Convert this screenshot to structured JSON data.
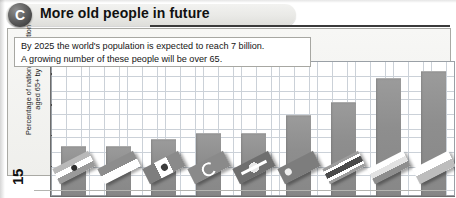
{
  "header": {
    "badge_letter": "C",
    "title": "More old people in future",
    "badge_icon": "circle-letter-badge"
  },
  "figure": {
    "number": "15",
    "y_axis_label": "Percentage of national population\naged 65+ by 2025",
    "note_lines": [
      "By 2025 the world's population is expected to reach 7 billion.",
      "A growing number of these people will be over 65."
    ]
  },
  "chart_data": {
    "type": "bar",
    "title": "More old people in future",
    "xlabel": "",
    "ylabel": "Percentage of national population aged 65+ by 2025",
    "ylim": [
      0,
      22
    ],
    "yticks": [
      5,
      10,
      15,
      20
    ],
    "grid": true,
    "legend": "none",
    "annotations": [
      "By 2025 the world's population is expected to reach 7 billion.",
      "A growing number of these people will be over 65."
    ],
    "categories": [
      "India",
      "Indonesia",
      "Mexico",
      "Turkey",
      "Brazil",
      "China",
      "Thailand",
      "Russia",
      "Poland"
    ],
    "values": [
      8,
      8,
      9,
      10,
      10,
      13,
      15,
      19,
      20
    ],
    "series": [
      {
        "name": "Percentage of national population aged 65+ by 2025",
        "values": [
          8,
          8,
          9,
          10,
          10,
          13,
          15,
          19,
          20
        ]
      }
    ],
    "bar_overlays": [
      {
        "country": "India",
        "icon": "flag-india"
      },
      {
        "country": "Indonesia",
        "icon": "flag-indonesia"
      },
      {
        "country": "Mexico",
        "icon": "flag-mexico"
      },
      {
        "country": "Turkey",
        "icon": "flag-turkey"
      },
      {
        "country": "Brazil",
        "icon": "flag-brazil"
      },
      {
        "country": "China",
        "icon": "flag-china"
      },
      {
        "country": "Thailand",
        "icon": "flag-thailand"
      },
      {
        "country": "Russia",
        "icon": "flag-russia"
      },
      {
        "country": "Poland",
        "icon": "flag-poland"
      }
    ]
  },
  "colors": {
    "bar": "#8e8e8e",
    "grid": "#c9cfd6",
    "axis": "#6d6d6d",
    "panel": "#f4f4f2",
    "badge": "#404040",
    "text": "#1b1b1b"
  }
}
